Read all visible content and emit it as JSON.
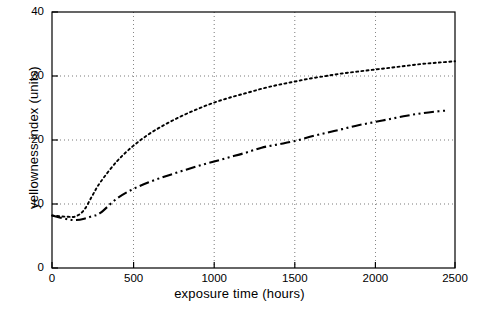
{
  "chart_data": {
    "type": "line",
    "title": "",
    "xlabel": "exposure time (hours)",
    "ylabel": "yellowness index (units)",
    "xlim": [
      0,
      2500
    ],
    "ylim": [
      0,
      40
    ],
    "xticks": [
      0,
      500,
      1000,
      1500,
      2000,
      2500
    ],
    "yticks": [
      0,
      10,
      20,
      30,
      40
    ],
    "xtick_labels": [
      "0",
      "500",
      "1000",
      "1500",
      "2000",
      "2500"
    ],
    "ytick_labels": [
      "0",
      "10",
      "20",
      "30",
      "40"
    ],
    "grid": true,
    "grid_style": "dotted",
    "legend": null,
    "series": [
      {
        "name": "dotted-curve",
        "style": "dotted",
        "color": "#000000",
        "x": [
          0,
          100,
          150,
          200,
          250,
          300,
          400,
          500,
          600,
          700,
          800,
          900,
          1000,
          1100,
          1200,
          1300,
          1400,
          1500,
          1600,
          1700,
          1800,
          1900,
          2000,
          2100,
          2200,
          2300,
          2400,
          2500
        ],
        "y": [
          8.2,
          8.0,
          8.1,
          9.1,
          11.3,
          13.4,
          16.6,
          19.0,
          20.9,
          22.4,
          23.7,
          24.8,
          25.8,
          26.6,
          27.3,
          28.0,
          28.6,
          29.1,
          29.6,
          30.0,
          30.4,
          30.7,
          31.0,
          31.3,
          31.6,
          31.9,
          32.1,
          32.3
        ]
      },
      {
        "name": "dash-dot-curve",
        "style": "dash-dot-dot",
        "color": "#000000",
        "x": [
          0,
          100,
          150,
          200,
          250,
          300,
          400,
          500,
          600,
          700,
          800,
          900,
          1000,
          1100,
          1200,
          1300,
          1400,
          1500,
          1600,
          1700,
          1800,
          1900,
          2000,
          2100,
          2200,
          2300,
          2400,
          2450
        ],
        "y": [
          8.2,
          7.6,
          7.5,
          7.7,
          8.1,
          8.6,
          10.8,
          12.3,
          13.4,
          14.3,
          15.1,
          15.9,
          16.6,
          17.3,
          18.0,
          18.8,
          19.3,
          19.8,
          20.5,
          21.1,
          21.7,
          22.3,
          22.8,
          23.3,
          23.8,
          24.2,
          24.5,
          24.6
        ]
      }
    ]
  }
}
